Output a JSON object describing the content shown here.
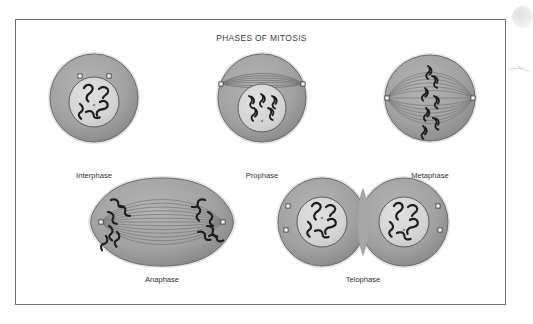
{
  "figure": {
    "title": "PHASES OF MITOSIS",
    "frame_border_color": "#6f6f72",
    "background_color": "#ffffff",
    "palette": {
      "cytoplasm": "#a0a0a0",
      "cytoplasm_edge": "#6b6b6d",
      "nucleus": "#d5d5d5",
      "nucleus_edge": "#5c5c5e",
      "chromosome": "#1c1c1c",
      "spindle_fiber": "#7a7a7c",
      "centriole_fill": "#f2f2f2",
      "centriole_edge": "#3b3b3d",
      "label_text": "#303032",
      "title_text": "#3a3a3c"
    }
  },
  "phases": [
    {
      "id": "interphase",
      "label": "Interphase",
      "row": 1,
      "column": 1,
      "shape": "circle",
      "has_nucleus": true,
      "nucleus_count": 1,
      "chromosome_groups": 4,
      "centriole_count": 2,
      "centriole_position": "top-inside-cytoplasm",
      "spindle_fibers": 0,
      "description": "Single round cell with intact nucleus holding loose squiggly chromatin; two centrioles sit above the nucleus."
    },
    {
      "id": "prophase",
      "label": "Prophase",
      "row": 1,
      "column": 2,
      "shape": "circle",
      "has_nucleus": true,
      "nucleus_count": 1,
      "chromosome_groups": 4,
      "centriole_count": 2,
      "centriole_position": "left-and-right-equator",
      "spindle_fibers": 7,
      "description": "Round cell; condensed chromosomes inside a lower nucleus while a lens-shaped bundle of spindle fibers forms between the two poles above it."
    },
    {
      "id": "metaphase",
      "label": "Metaphase",
      "row": 1,
      "column": 3,
      "shape": "circle",
      "has_nucleus": false,
      "nucleus_count": 0,
      "chromosome_groups": 4,
      "centriole_count": 2,
      "centriole_position": "left-and-right-poles",
      "spindle_fibers": 13,
      "description": "Nuclear envelope gone; spindle fibers span pole to pole and four chromosomes line up on the vertical equator."
    },
    {
      "id": "anaphase",
      "label": "Anaphase",
      "row": 2,
      "column": 1,
      "shape": "oval-constricting",
      "has_nucleus": false,
      "nucleus_count": 0,
      "chromosome_groups": 8,
      "centriole_count": 2,
      "centriole_position": "left-and-right-poles",
      "spindle_fibers": 13,
      "description": "Cell elongated with a faint waist; sister chromatids have been pulled apart into two clusters at opposite poles."
    },
    {
      "id": "telophase",
      "label": "Telophase",
      "row": 2,
      "column": 2,
      "shape": "two-overlapping-circles",
      "has_nucleus": true,
      "nucleus_count": 2,
      "chromosome_groups": 8,
      "centriole_count": 4,
      "centriole_position": "outer-left-and-outer-right-pairs",
      "spindle_fibers": 0,
      "description": "Two daughter cells pinching apart, each rebuilding a nucleus full of chromatin; a pair of centrioles sits at each outer edge."
    }
  ],
  "artifacts": [
    {
      "id": "scan-blob",
      "name": "scanner-smudge",
      "location": "top-right-outside-frame"
    },
    {
      "id": "scan-mark",
      "name": "scanner-streak",
      "location": "right-edge-outside-frame"
    }
  ]
}
